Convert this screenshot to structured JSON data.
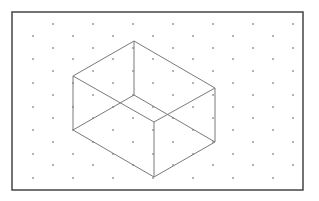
{
  "figure": {
    "colors": {
      "background": "#ffffff",
      "border": "#444444",
      "dot": "#555555",
      "edge": "#7a7a7a"
    },
    "border": {
      "x": 12,
      "y": 12,
      "width": 291,
      "height": 178
    },
    "grid": {
      "rows_y": [
        24,
        36,
        48,
        59,
        71,
        83,
        95,
        107,
        118,
        130,
        142,
        154,
        165,
        178
      ],
      "odd_row_x": [
        53,
        93,
        133,
        173,
        213,
        253,
        293
      ],
      "even_row_x": [
        33,
        73,
        113,
        153,
        193,
        233,
        273
      ],
      "dot_radius": 0.8
    },
    "box": {
      "vertices": {
        "top_back": [
          134,
          41
        ],
        "top_left": [
          73,
          76
        ],
        "top_front": [
          154,
          122
        ],
        "top_right": [
          215,
          88
        ],
        "bottom_back": [
          134,
          95
        ],
        "bottom_left": [
          73,
          130
        ],
        "bottom_front": [
          154,
          177
        ],
        "bottom_right": [
          215,
          142
        ]
      },
      "edges": [
        [
          "top_back",
          "top_left"
        ],
        [
          "top_back",
          "top_right"
        ],
        [
          "top_left",
          "top_front"
        ],
        [
          "top_front",
          "top_right"
        ],
        [
          "top_left",
          "bottom_left"
        ],
        [
          "top_front",
          "bottom_front"
        ],
        [
          "top_right",
          "bottom_right"
        ],
        [
          "top_back",
          "bottom_back"
        ],
        [
          "bottom_left",
          "bottom_front"
        ],
        [
          "bottom_front",
          "bottom_right"
        ],
        [
          "bottom_left",
          "bottom_back"
        ],
        [
          "bottom_back",
          "bottom_right"
        ]
      ]
    }
  }
}
